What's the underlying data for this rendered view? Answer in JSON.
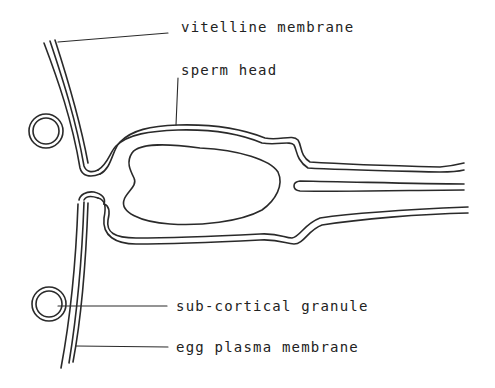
{
  "diagram": {
    "type": "labeled-schematic",
    "colors": {
      "stroke": "#2a2a2a",
      "background": "#ffffff",
      "text": "#222222"
    },
    "labels": [
      {
        "id": "vitelline",
        "text": "vitelline membrane",
        "x": 181,
        "y": 19
      },
      {
        "id": "sperm_head",
        "text": "sperm head",
        "x": 181,
        "y": 62
      },
      {
        "id": "granule",
        "text": "sub-cortical granule",
        "x": 176,
        "y": 290
      },
      {
        "id": "egg_membrane",
        "text": "egg plasma membrane",
        "x": 176,
        "y": 332
      }
    ]
  }
}
